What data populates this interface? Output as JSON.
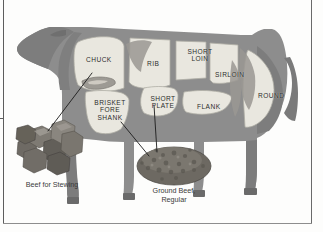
{
  "figure": {
    "animal": "beef-cow-diagram",
    "colors": {
      "body": "#8d8d8d",
      "body_dark": "#6f6f6f",
      "cut_fill": "#e9e7df",
      "cut_outline": "#b4b2aa",
      "meat": "#7a7670",
      "meat_dark": "#55524c",
      "leader_line": "#1f1f1f",
      "frame": "#5d5d5d",
      "page": "#fdfdfc"
    },
    "cuts": [
      {
        "id": "chuck",
        "label": "CHUCK",
        "lines": [
          "CHUCK"
        ],
        "x": 85,
        "y": 56
      },
      {
        "id": "rib",
        "label": "RIB",
        "lines": [
          "RIB"
        ],
        "x": 154,
        "y": 60
      },
      {
        "id": "short-loin",
        "label": "SHORT LOIN",
        "lines": [
          "SHORT",
          "LOIN"
        ],
        "x": 190,
        "y": 50
      },
      {
        "id": "sirloin",
        "label": "SIRLOIN",
        "lines": [
          "SIRLOIN"
        ],
        "x": 219,
        "y": 69
      },
      {
        "id": "round",
        "label": "ROUND",
        "lines": [
          "ROUND"
        ],
        "x": 263,
        "y": 92
      },
      {
        "id": "flank",
        "label": "FLANK",
        "lines": [
          "FLANK"
        ],
        "x": 202,
        "y": 103
      },
      {
        "id": "short-plate",
        "label": "SHORT PLATE",
        "lines": [
          "SHORT",
          "PLATE"
        ],
        "x": 155,
        "y": 96
      },
      {
        "id": "brisket-fore-shank",
        "label": "BRISKET FORE SHANK",
        "lines": [
          "BRISKET",
          "FORE",
          "SHANK"
        ],
        "x": 104,
        "y": 99
      }
    ],
    "products": [
      {
        "id": "beef-for-stewing",
        "lines": [
          "Beef for Stewing"
        ],
        "caption_x": 13,
        "caption_y": 181,
        "points_to": "chuck"
      },
      {
        "id": "ground-beef-regular",
        "lines": [
          "Ground Beef,",
          "Regular"
        ],
        "caption_x": 140,
        "caption_y": 188,
        "points_to": "short-plate"
      }
    ]
  }
}
